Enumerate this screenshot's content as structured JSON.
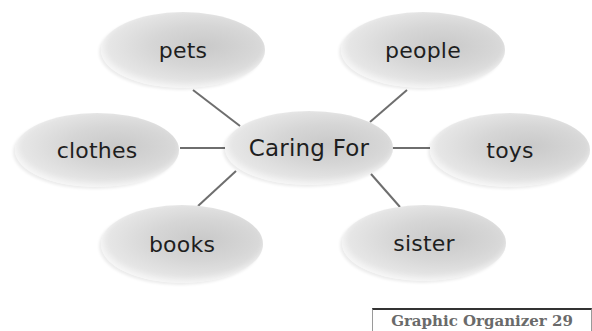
{
  "diagram": {
    "type": "web-graphic-organizer",
    "center": {
      "label": "Caring For",
      "cx": 309,
      "cy": 148,
      "rx": 84,
      "ry": 37
    },
    "nodes": [
      {
        "id": "pets",
        "label": "pets",
        "cx": 183,
        "cy": 50,
        "rx": 82,
        "ry": 38
      },
      {
        "id": "people",
        "label": "people",
        "cx": 423,
        "cy": 50,
        "rx": 82,
        "ry": 38
      },
      {
        "id": "clothes",
        "label": "clothes",
        "cx": 97,
        "cy": 150,
        "rx": 82,
        "ry": 37
      },
      {
        "id": "toys",
        "label": "toys",
        "cx": 510,
        "cy": 150,
        "rx": 80,
        "ry": 37
      },
      {
        "id": "books",
        "label": "books",
        "cx": 182,
        "cy": 244,
        "rx": 81,
        "ry": 39
      },
      {
        "id": "sister",
        "label": "sister",
        "cx": 424,
        "cy": 243,
        "rx": 82,
        "ry": 38
      }
    ],
    "connectors": [
      {
        "to": "pets",
        "x1": 193,
        "y1": 90,
        "x2": 240,
        "y2": 126
      },
      {
        "to": "people",
        "x1": 407,
        "y1": 90,
        "x2": 370,
        "y2": 122
      },
      {
        "to": "clothes",
        "x1": 180,
        "y1": 148,
        "x2": 225,
        "y2": 148
      },
      {
        "to": "toys",
        "x1": 389,
        "y1": 148,
        "x2": 430,
        "y2": 148
      },
      {
        "to": "books",
        "x1": 236,
        "y1": 171,
        "x2": 198,
        "y2": 206
      },
      {
        "to": "sister",
        "x1": 371,
        "y1": 174,
        "x2": 400,
        "y2": 207
      }
    ],
    "line_color": "#6e6e6e"
  },
  "caption": {
    "text": "Graphic Organizer 29"
  }
}
